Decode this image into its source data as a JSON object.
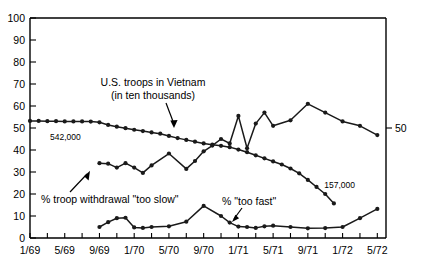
{
  "chart_data": {
    "type": "line",
    "title": "",
    "subtitle": "",
    "xlabel": "",
    "ylabel": "",
    "ylim": [
      0,
      100
    ],
    "grid": false,
    "legend_position": "none",
    "y_ticks": [
      "0",
      "10",
      "20",
      "30",
      "40",
      "50",
      "60",
      "70",
      "80",
      "90",
      "100"
    ],
    "y_tick_values": [
      0,
      10,
      20,
      30,
      40,
      50,
      60,
      70,
      80,
      90,
      100
    ],
    "x_tick_labels": [
      "1/69",
      "5/69",
      "9/69",
      "1/70",
      "5/70",
      "9/70",
      "1/71",
      "5/71",
      "9/71",
      "1/72",
      "5/72"
    ],
    "x_tick_values": [
      0,
      4,
      8,
      12,
      16,
      20,
      24,
      28,
      32,
      36,
      40
    ],
    "x_minor_step": 2,
    "x_range": [
      0,
      41
    ],
    "right_axis_labels": [
      {
        "text": "50",
        "value": 50
      }
    ],
    "series": [
      {
        "name": "U.S. troops in Vietnam (in ten thousands)",
        "x": [
          0,
          1,
          2,
          3,
          4,
          5,
          6,
          7,
          8,
          9,
          10,
          11,
          12,
          13,
          14,
          15,
          16,
          17,
          18,
          19,
          20,
          21,
          22,
          23,
          24,
          25,
          26,
          27,
          28,
          29,
          30,
          31,
          32,
          33,
          34,
          35
        ],
        "values": [
          53.2,
          53.2,
          53.1,
          53.1,
          53.0,
          53.0,
          53.0,
          52.9,
          52.6,
          51.4,
          50.6,
          49.9,
          49.2,
          48.6,
          48.0,
          47.4,
          46.4,
          45.4,
          44.6,
          43.8,
          43.0,
          42.4,
          41.9,
          41.3,
          40.2,
          39.0,
          37.6,
          36.2,
          34.8,
          33.4,
          31.6,
          29.4,
          26.4,
          23.2,
          20.0,
          15.7
        ]
      },
      {
        "name": "% troop withdrawal \"too slow\"",
        "x": [
          8,
          9,
          10,
          11,
          12,
          13,
          14,
          16,
          18,
          19,
          20,
          21,
          22,
          23,
          24,
          25,
          26,
          27,
          28,
          30,
          32,
          34,
          36,
          38,
          40
        ],
        "values": [
          34.0,
          33.8,
          32.0,
          34.0,
          32.0,
          29.6,
          33.0,
          38.4,
          31.4,
          35.0,
          39.4,
          42.0,
          45.0,
          43.0,
          55.5,
          40.8,
          52.0,
          57.0,
          51.0,
          53.5,
          61.0,
          57.0,
          53.0,
          51.0,
          46.8
        ]
      },
      {
        "name": "% \"too fast\"",
        "x": [
          8,
          9,
          10,
          11,
          12,
          13,
          14,
          16,
          18,
          20,
          22,
          23,
          24,
          25,
          26,
          27,
          28,
          30,
          32,
          34,
          36,
          38,
          40
        ],
        "values": [
          5.0,
          7.2,
          9.0,
          9.2,
          4.8,
          4.6,
          5.0,
          5.3,
          7.4,
          14.6,
          10.0,
          7.0,
          5.2,
          5.0,
          4.6,
          5.3,
          5.6,
          5.0,
          4.4,
          4.5,
          5.0,
          9.0,
          13.2
        ]
      }
    ],
    "annotations": [
      {
        "id": "troops-label",
        "lines": [
          "U.S. troops in Vietnam",
          "(in ten thousands)"
        ],
        "text": "U.S. troops in Vietnam (in ten thousands)"
      },
      {
        "id": "too-slow-label",
        "text": "% troop withdrawal \"too slow\""
      },
      {
        "id": "too-fast-label",
        "text": "% \"too fast\""
      },
      {
        "id": "troops-start-value",
        "text": "542,000"
      },
      {
        "id": "troops-end-value",
        "text": "157,000"
      }
    ]
  }
}
